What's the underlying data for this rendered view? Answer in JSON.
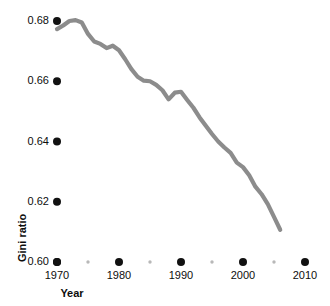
{
  "chart_data": {
    "type": "line",
    "title": "",
    "xlabel": "Year",
    "ylabel": "Gini ratio",
    "xlim": [
      1968.8,
      2011.5
    ],
    "ylim": [
      0.6,
      0.688
    ],
    "grid": false,
    "legend": "none",
    "line_color": "#8c8c8c",
    "tick_color": "#111111",
    "minor_tick_color": "#b8b8b8",
    "background": "#ffffff",
    "yticks": [
      "0.60",
      "0.62",
      "0.64",
      "0.66",
      "0.68"
    ],
    "ytick_values": [
      0.6,
      0.62,
      0.64,
      0.66,
      0.68
    ],
    "xticks": [
      "1970",
      "1980",
      "1990",
      "2000",
      "2010"
    ],
    "xtick_values": [
      1970,
      1980,
      1990,
      2000,
      2010
    ],
    "xminor_ticks": [
      1975,
      1985,
      1995,
      2005
    ],
    "series": [
      {
        "name": "Gini ratio",
        "x": [
          1970,
          1971,
          1972,
          1973,
          1974,
          1975,
          1976,
          1977,
          1978,
          1979,
          1980,
          1981,
          1982,
          1983,
          1984,
          1985,
          1986,
          1987,
          1988,
          1989,
          1990,
          1991,
          1992,
          1993,
          1994,
          1995,
          1996,
          1997,
          1998,
          1999,
          2000,
          2001,
          2002,
          2003,
          2004,
          2005,
          2006
        ],
        "values": [
          0.6773,
          0.6785,
          0.68,
          0.6803,
          0.6795,
          0.6757,
          0.6732,
          0.6724,
          0.671,
          0.6718,
          0.6703,
          0.6673,
          0.664,
          0.6615,
          0.6602,
          0.66,
          0.6588,
          0.657,
          0.654,
          0.6562,
          0.6565,
          0.6538,
          0.6512,
          0.648,
          0.6452,
          0.6425,
          0.64,
          0.638,
          0.6362,
          0.633,
          0.6315,
          0.6288,
          0.625,
          0.6225,
          0.6192,
          0.615,
          0.6107
        ]
      }
    ]
  },
  "axis": {
    "y_label_text": "Gini ratio",
    "x_label_text": "Year"
  }
}
